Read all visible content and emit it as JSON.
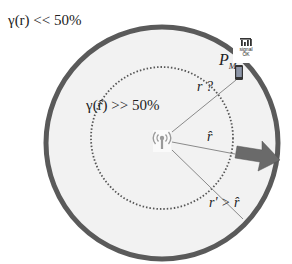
{
  "labels": {
    "outer_condition": "γ(r) << 50%",
    "inner_condition": "γ(r̂) >> 50%",
    "mobile_label": "P",
    "mobile_subscript": "M",
    "signal_text_line1": "signal",
    "signal_text_line2": "OK",
    "r_unknown": "r ?",
    "r_hat": "r̂",
    "r_prime_compare": "r' > r̂"
  },
  "icons": {
    "base_station": "antenna-broadcast-icon",
    "signal": "signal-bars-icon",
    "phone": "smartphone-icon",
    "arrow": "right-arrow-icon"
  },
  "colors": {
    "outer_ring": "#5a5a5a",
    "disk_fill": "#f2f2f2",
    "dotted_ring": "#555555",
    "arrow": "#6a6a6a",
    "lines": "#8a8a8a",
    "text": "#222222"
  }
}
